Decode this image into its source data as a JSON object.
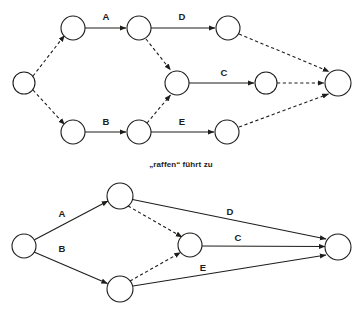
{
  "figure": {
    "caption": "„raffen“ führt zu",
    "background_color": "#ffffff",
    "stroke_color": "#1d1d1b",
    "node_fill": "#ffffff"
  },
  "diagrams": [
    {
      "id": "expanded-graph",
      "name": "expanded-activity-graph",
      "nodes": [
        {
          "id": "n-start",
          "name": "start-node",
          "cx": 24,
          "cy": 83,
          "r": 11
        },
        {
          "id": "n-top-1",
          "name": "top-node-1",
          "cx": 73,
          "cy": 28,
          "r": 12
        },
        {
          "id": "n-top-2",
          "name": "top-node-2",
          "cx": 139,
          "cy": 28,
          "r": 12
        },
        {
          "id": "n-top-3",
          "name": "top-node-3",
          "cx": 228,
          "cy": 28,
          "r": 12
        },
        {
          "id": "n-mid",
          "name": "middle-node",
          "cx": 177,
          "cy": 83,
          "r": 12
        },
        {
          "id": "n-mid-right",
          "name": "middle-right-node",
          "cx": 266,
          "cy": 83,
          "r": 11
        },
        {
          "id": "n-bot-1",
          "name": "bottom-node-1",
          "cx": 73,
          "cy": 132,
          "r": 12
        },
        {
          "id": "n-bot-2",
          "name": "bottom-node-2",
          "cx": 139,
          "cy": 132,
          "r": 12
        },
        {
          "id": "n-bot-3",
          "name": "bottom-node-3",
          "cx": 227,
          "cy": 132,
          "r": 12
        },
        {
          "id": "n-end",
          "name": "end-node",
          "cx": 338,
          "cy": 83,
          "r": 13
        }
      ],
      "edges": [
        {
          "from": "n-start",
          "to": "n-top-1",
          "style": "dashed",
          "label": ""
        },
        {
          "from": "n-start",
          "to": "n-bot-1",
          "style": "dashed",
          "label": ""
        },
        {
          "from": "n-top-1",
          "to": "n-top-2",
          "style": "solid",
          "label": "A"
        },
        {
          "from": "n-top-2",
          "to": "n-top-3",
          "style": "solid",
          "label": "D"
        },
        {
          "from": "n-top-2",
          "to": "n-mid",
          "style": "dashed",
          "label": ""
        },
        {
          "from": "n-mid",
          "to": "n-mid-right",
          "style": "solid",
          "label": "C"
        },
        {
          "from": "n-mid-right",
          "to": "n-end",
          "style": "dashed",
          "label": ""
        },
        {
          "from": "n-top-3",
          "to": "n-end",
          "style": "dashed",
          "label": ""
        },
        {
          "from": "n-bot-1",
          "to": "n-bot-2",
          "style": "solid",
          "label": "B"
        },
        {
          "from": "n-bot-2",
          "to": "n-mid",
          "style": "dashed",
          "label": ""
        },
        {
          "from": "n-bot-2",
          "to": "n-bot-3",
          "style": "solid",
          "label": "E"
        },
        {
          "from": "n-bot-3",
          "to": "n-end",
          "style": "dashed",
          "label": ""
        }
      ],
      "labels": [
        {
          "text": "A",
          "x": 106,
          "y": 20
        },
        {
          "text": "D",
          "x": 182,
          "y": 20
        },
        {
          "text": "C",
          "x": 224,
          "y": 75
        },
        {
          "text": "B",
          "x": 106,
          "y": 125
        },
        {
          "text": "E",
          "x": 182,
          "y": 125
        }
      ]
    },
    {
      "id": "condensed-graph",
      "name": "condensed-activity-graph",
      "nodes": [
        {
          "id": "c-start",
          "name": "start-node",
          "cx": 24,
          "cy": 246,
          "r": 12
        },
        {
          "id": "c-top",
          "name": "top-node",
          "cx": 120,
          "cy": 196,
          "r": 13
        },
        {
          "id": "c-bot",
          "name": "bottom-node",
          "cx": 120,
          "cy": 289,
          "r": 13
        },
        {
          "id": "c-mid",
          "name": "middle-node",
          "cx": 190,
          "cy": 245,
          "r": 12
        },
        {
          "id": "c-end",
          "name": "end-node",
          "cx": 338,
          "cy": 247,
          "r": 13
        }
      ],
      "edges": [
        {
          "from": "c-start",
          "to": "c-top",
          "style": "solid",
          "label": "A"
        },
        {
          "from": "c-start",
          "to": "c-bot",
          "style": "solid",
          "label": "B"
        },
        {
          "from": "c-top",
          "to": "c-mid",
          "style": "dashed",
          "label": ""
        },
        {
          "from": "c-bot",
          "to": "c-mid",
          "style": "dashed",
          "label": ""
        },
        {
          "from": "c-top",
          "to": "c-end",
          "style": "solid",
          "label": "D"
        },
        {
          "from": "c-mid",
          "to": "c-end",
          "style": "solid",
          "label": "C"
        },
        {
          "from": "c-bot",
          "to": "c-end",
          "style": "solid",
          "label": "E"
        }
      ],
      "labels": [
        {
          "text": "A",
          "x": 62,
          "y": 216
        },
        {
          "text": "B",
          "x": 62,
          "y": 250
        },
        {
          "text": "D",
          "x": 230,
          "y": 214
        },
        {
          "text": "C",
          "x": 238,
          "y": 241
        },
        {
          "text": "E",
          "x": 203,
          "y": 271
        }
      ]
    }
  ]
}
